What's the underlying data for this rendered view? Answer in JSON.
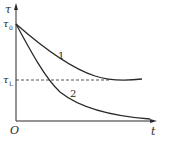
{
  "diagram": {
    "type": "decay-curves",
    "axes": {
      "y_label": "τ",
      "x_label": "t",
      "origin_label": "O"
    },
    "y_marks": [
      {
        "label": "τ",
        "subscript": "0",
        "meaning": "initial value"
      },
      {
        "label": "τ",
        "subscript": "L",
        "meaning": "limit value (dashed line)"
      }
    ],
    "curves": [
      {
        "id": "1",
        "label": "1",
        "description": "decays from τ0 and levels off at τL"
      },
      {
        "id": "2",
        "label": "2",
        "description": "decays from τ0 below τL toward zero"
      }
    ],
    "colors": {
      "line": "#2a2a2a",
      "background": "#ffffff"
    }
  }
}
